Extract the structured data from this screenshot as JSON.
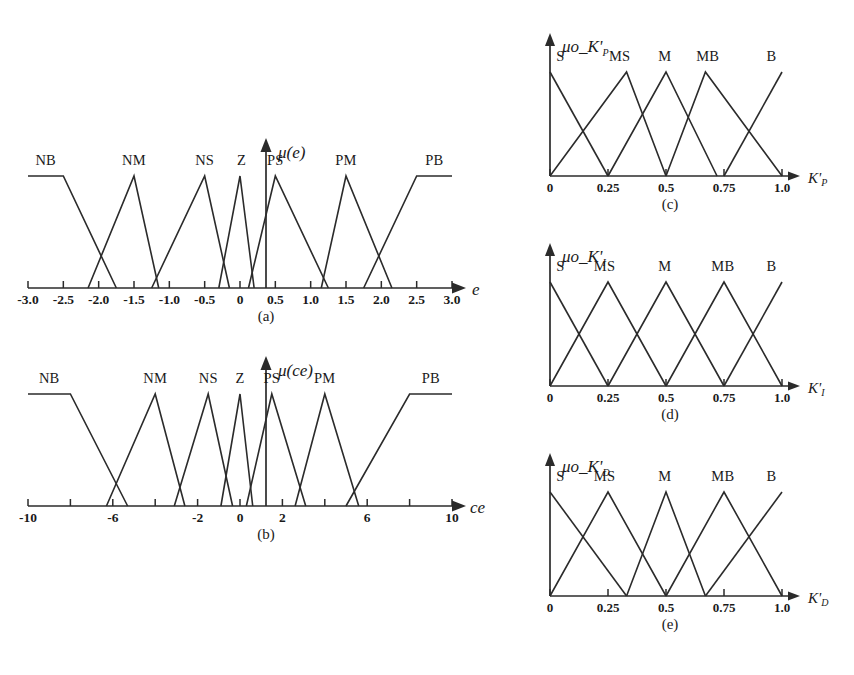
{
  "figure": {
    "background": "#ffffff",
    "line_color": "#2b2b2b",
    "panels": [
      "a",
      "b",
      "c",
      "d",
      "e"
    ]
  },
  "captions": {
    "a": "(a)",
    "b": "(b)",
    "c": "(c)",
    "d": "(d)",
    "e": "(e)"
  },
  "chart_data": [
    {
      "id": "a",
      "type": "line",
      "title": "",
      "ylabel": "μ(e)",
      "xlabel": "e",
      "xlim": [
        -3.0,
        3.0
      ],
      "ylim": [
        0,
        1
      ],
      "grid": false,
      "legend_position": "inline-above-peaks",
      "xticks": [
        -3.0,
        -2.5,
        -2.0,
        -1.5,
        -1.0,
        -0.5,
        0,
        0.5,
        1.0,
        1.5,
        2.0,
        2.5,
        3.0
      ],
      "xticklabels": [
        "-3.0",
        "-2.5",
        "-2.0",
        "-1.5",
        "-1.0",
        "-0.5",
        "0",
        "0.5",
        "1.0",
        "1.5",
        "2.0",
        "2.5",
        "3.0"
      ],
      "series": [
        {
          "name": "NB",
          "shape": "trapezoid",
          "points": [
            [
              -3.0,
              1
            ],
            [
              -2.5,
              1
            ],
            [
              -1.75,
              0
            ]
          ],
          "label_x": -2.75
        },
        {
          "name": "NM",
          "shape": "triangle",
          "points": [
            [
              -2.15,
              0
            ],
            [
              -1.5,
              1
            ],
            [
              -1.15,
              0
            ]
          ],
          "label_x": -1.5
        },
        {
          "name": "NS",
          "shape": "triangle",
          "points": [
            [
              -1.25,
              0
            ],
            [
              -0.5,
              1
            ],
            [
              -0.15,
              0
            ]
          ],
          "label_x": -0.5
        },
        {
          "name": "Z",
          "shape": "triangle",
          "points": [
            [
              -0.3,
              0
            ],
            [
              0,
              1
            ],
            [
              0.2,
              0
            ]
          ],
          "label_x": 0.02
        },
        {
          "name": "PS",
          "shape": "triangle",
          "points": [
            [
              0.12,
              0
            ],
            [
              0.5,
              1
            ],
            [
              1.25,
              0
            ]
          ],
          "label_x": 0.5
        },
        {
          "name": "PM",
          "shape": "triangle",
          "points": [
            [
              1.15,
              0
            ],
            [
              1.5,
              1
            ],
            [
              2.15,
              0
            ]
          ],
          "label_x": 1.5
        },
        {
          "name": "PB",
          "shape": "trapezoid",
          "points": [
            [
              1.75,
              0
            ],
            [
              2.5,
              1
            ],
            [
              3.0,
              1
            ]
          ],
          "label_x": 2.75
        }
      ]
    },
    {
      "id": "b",
      "type": "line",
      "title": "",
      "ylabel": "μ(ce)",
      "xlabel": "ce",
      "xlim": [
        -10,
        10
      ],
      "ylim": [
        0,
        1
      ],
      "grid": false,
      "legend_position": "inline-above-peaks",
      "xticks": [
        -10,
        -8,
        -6,
        -4,
        -2,
        0,
        2,
        4,
        6,
        8,
        10
      ],
      "xticklabels": [
        "-10",
        "",
        "-6",
        "",
        "-2",
        "0",
        "2",
        "",
        "6",
        "",
        "10"
      ],
      "series": [
        {
          "name": "NB",
          "shape": "trapezoid",
          "points": [
            [
              -10,
              1
            ],
            [
              -8,
              1
            ],
            [
              -5.3,
              0
            ]
          ],
          "label_x": -9.0
        },
        {
          "name": "NM",
          "shape": "triangle",
          "points": [
            [
              -6.3,
              0
            ],
            [
              -4,
              1
            ],
            [
              -2.6,
              0
            ]
          ],
          "label_x": -4.0
        },
        {
          "name": "NS",
          "shape": "triangle",
          "points": [
            [
              -3.1,
              0
            ],
            [
              -1.5,
              1
            ],
            [
              -0.35,
              0
            ]
          ],
          "label_x": -1.5
        },
        {
          "name": "Z",
          "shape": "triangle",
          "points": [
            [
              -0.9,
              0
            ],
            [
              0,
              1
            ],
            [
              0.6,
              0
            ]
          ],
          "label_x": 0.0
        },
        {
          "name": "PS",
          "shape": "triangle",
          "points": [
            [
              0.3,
              0
            ],
            [
              1.5,
              1
            ],
            [
              3.1,
              0
            ]
          ],
          "label_x": 1.5
        },
        {
          "name": "PM",
          "shape": "triangle",
          "points": [
            [
              2.6,
              0
            ],
            [
              4,
              1
            ],
            [
              5.6,
              0
            ]
          ],
          "label_x": 4.0
        },
        {
          "name": "PB",
          "shape": "trapezoid",
          "points": [
            [
              5.0,
              0
            ],
            [
              8,
              1
            ],
            [
              10,
              1
            ]
          ],
          "label_x": 9.0
        }
      ]
    },
    {
      "id": "c",
      "type": "line",
      "title": "",
      "ylabel": "μo_K'",
      "ylabel_sub": "P",
      "xlabel": "K'",
      "xlabel_sub": "P",
      "xlim": [
        0,
        1.0
      ],
      "ylim": [
        0,
        1
      ],
      "grid": false,
      "legend_position": "inline-above-peaks",
      "xticks": [
        0,
        0.25,
        0.5,
        0.75,
        1.0
      ],
      "xticklabels": [
        "0",
        "0.25",
        "0.5",
        "0.75",
        "1.0"
      ],
      "series": [
        {
          "name": "S",
          "shape": "right-triangle",
          "points": [
            [
              0,
              1
            ],
            [
              0.25,
              0
            ]
          ],
          "label_x": 0.045
        },
        {
          "name": "MS",
          "shape": "triangle",
          "points": [
            [
              0,
              0
            ],
            [
              0.33,
              1
            ],
            [
              0.5,
              0
            ]
          ],
          "label_x": 0.3
        },
        {
          "name": "M",
          "shape": "triangle",
          "points": [
            [
              0.25,
              0
            ],
            [
              0.5,
              1
            ],
            [
              0.72,
              0
            ]
          ],
          "label_x": 0.495
        },
        {
          "name": "MB",
          "shape": "triangle",
          "points": [
            [
              0.5,
              0
            ],
            [
              0.67,
              1
            ],
            [
              1.0,
              0
            ]
          ],
          "label_x": 0.68
        },
        {
          "name": "B",
          "shape": "right-triangle",
          "points": [
            [
              0.75,
              0
            ],
            [
              1.0,
              1
            ]
          ],
          "label_x": 0.955
        }
      ]
    },
    {
      "id": "d",
      "type": "line",
      "title": "",
      "ylabel": "μo_K'",
      "ylabel_sub": "I",
      "xlabel": "K'",
      "xlabel_sub": "I",
      "xlim": [
        0,
        1.0
      ],
      "ylim": [
        0,
        1
      ],
      "grid": false,
      "legend_position": "inline-above-peaks",
      "xticks": [
        0,
        0.25,
        0.5,
        0.75,
        1.0
      ],
      "xticklabels": [
        "0",
        "0.25",
        "0.5",
        "0.75",
        "1.0"
      ],
      "series": [
        {
          "name": "S",
          "shape": "right-triangle",
          "points": [
            [
              0,
              1
            ],
            [
              0.25,
              0
            ]
          ],
          "label_x": 0.045
        },
        {
          "name": "MS",
          "shape": "triangle",
          "points": [
            [
              0,
              0
            ],
            [
              0.25,
              1
            ],
            [
              0.5,
              0
            ]
          ],
          "label_x": 0.235
        },
        {
          "name": "M",
          "shape": "triangle",
          "points": [
            [
              0.25,
              0
            ],
            [
              0.5,
              1
            ],
            [
              0.75,
              0
            ]
          ],
          "label_x": 0.495
        },
        {
          "name": "MB",
          "shape": "triangle",
          "points": [
            [
              0.5,
              0
            ],
            [
              0.75,
              1
            ],
            [
              1.0,
              0
            ]
          ],
          "label_x": 0.745
        },
        {
          "name": "B",
          "shape": "right-triangle",
          "points": [
            [
              0.75,
              0
            ],
            [
              1.0,
              1
            ]
          ],
          "label_x": 0.955
        }
      ]
    },
    {
      "id": "e",
      "type": "line",
      "title": "",
      "ylabel": "μo_K'",
      "ylabel_sub": "D",
      "xlabel": "K'",
      "xlabel_sub": "D",
      "xlim": [
        0,
        1.0
      ],
      "ylim": [
        0,
        1
      ],
      "grid": false,
      "legend_position": "inline-above-peaks",
      "xticks": [
        0,
        0.25,
        0.5,
        0.75,
        1.0
      ],
      "xticklabels": [
        "0",
        "0.25",
        "0.5",
        "0.75",
        "1.0"
      ],
      "series": [
        {
          "name": "S",
          "shape": "right-triangle",
          "points": [
            [
              0,
              1
            ],
            [
              0.33,
              0
            ]
          ],
          "label_x": 0.045
        },
        {
          "name": "MS",
          "shape": "triangle",
          "points": [
            [
              0,
              0
            ],
            [
              0.25,
              1
            ],
            [
              0.5,
              0
            ]
          ],
          "label_x": 0.235
        },
        {
          "name": "M",
          "shape": "triangle",
          "points": [
            [
              0.33,
              0
            ],
            [
              0.5,
              1
            ],
            [
              0.67,
              0
            ]
          ],
          "label_x": 0.495
        },
        {
          "name": "MB",
          "shape": "triangle",
          "points": [
            [
              0.5,
              0
            ],
            [
              0.75,
              1
            ],
            [
              1.0,
              0
            ]
          ],
          "label_x": 0.745
        },
        {
          "name": "B",
          "shape": "right-triangle",
          "points": [
            [
              0.67,
              0
            ],
            [
              1.0,
              1
            ]
          ],
          "label_x": 0.955
        }
      ]
    }
  ]
}
